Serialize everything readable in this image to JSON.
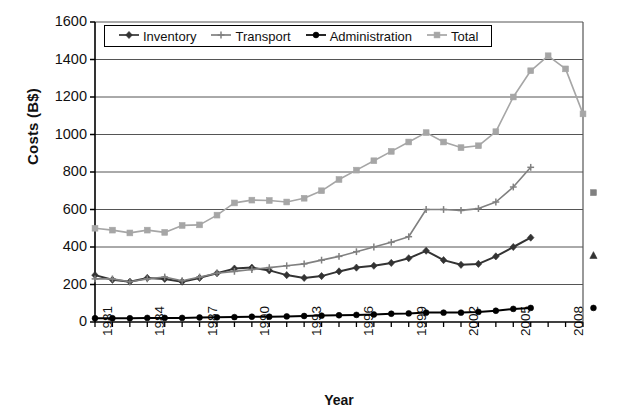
{
  "chart_data": {
    "type": "line",
    "title": "",
    "xlabel": "Year",
    "ylabel": "Costs (B$)",
    "xlim": [
      1981,
      2009
    ],
    "ylim": [
      0,
      1600
    ],
    "ytick_step": 200,
    "yticks": [
      "0",
      "200",
      "400",
      "600",
      "800",
      "1000",
      "1200",
      "1400",
      "1600"
    ],
    "xticks": [
      "1981",
      "1984",
      "1987",
      "1990",
      "1993",
      "1996",
      "1999",
      "2002",
      "2005",
      "2008"
    ],
    "xticks_all": [
      1981,
      1982,
      1983,
      1984,
      1985,
      1986,
      1987,
      1988,
      1989,
      1990,
      1991,
      1992,
      1993,
      1994,
      1995,
      1996,
      1997,
      1998,
      1999,
      2000,
      2001,
      2002,
      2003,
      2004,
      2005,
      2006,
      2007,
      2008,
      2009
    ],
    "grid": "horizontal",
    "legend_position": "top-inside",
    "x": [
      1981,
      1982,
      1983,
      1984,
      1985,
      1986,
      1987,
      1988,
      1989,
      1990,
      1991,
      1992,
      1993,
      1994,
      1995,
      1996,
      1997,
      1998,
      1999,
      2000,
      2001,
      2002,
      2003,
      2004,
      2005,
      2006
    ],
    "series": [
      {
        "name": "Inventory",
        "color": "#333333",
        "marker": "diamond",
        "values": [
          250,
          225,
          215,
          235,
          230,
          215,
          235,
          260,
          285,
          290,
          275,
          250,
          235,
          245,
          270,
          290,
          300,
          315,
          340,
          380,
          330,
          305,
          310,
          350,
          400,
          450
        ]
      },
      {
        "name": "Transport",
        "color": "#808080",
        "marker": "plus",
        "values": [
          230,
          230,
          215,
          230,
          240,
          220,
          240,
          260,
          270,
          280,
          290,
          300,
          310,
          330,
          350,
          375,
          400,
          425,
          455,
          600,
          600,
          595,
          605,
          640,
          720,
          825
        ]
      },
      {
        "name": "Administration",
        "color": "#000000",
        "marker": "circle",
        "values": [
          20,
          20,
          20,
          22,
          22,
          22,
          24,
          25,
          26,
          28,
          28,
          30,
          32,
          34,
          36,
          38,
          40,
          44,
          46,
          50,
          50,
          50,
          54,
          60,
          70,
          75
        ]
      },
      {
        "name": "Total",
        "color": "#a6a6a6",
        "marker": "square",
        "values": [
          500,
          490,
          475,
          490,
          478,
          515,
          518,
          570,
          635,
          650,
          648,
          640,
          660,
          700,
          760,
          810,
          860,
          910,
          960,
          1010,
          960,
          930,
          940,
          1015,
          1200,
          1340
        ]
      }
    ],
    "extra_points": [
      {
        "series": "Total",
        "x": 2007,
        "y": 1420
      },
      {
        "series": "Total",
        "x": 2008,
        "y": 1350
      },
      {
        "series": "Total",
        "x": 2009,
        "y": 1110
      }
    ],
    "isolated_markers": [
      {
        "series": "Total",
        "label": "Total-2009-marker",
        "x": 2009.6,
        "y": 690,
        "marker": "square",
        "color": "#808080"
      },
      {
        "series": "Inventory",
        "label": "Inventory-2009-marker",
        "x": 2009.6,
        "y": 355,
        "marker": "triangle",
        "color": "#333333"
      },
      {
        "series": "Administration",
        "label": "Administration-2009-marker",
        "x": 2009.6,
        "y": 75,
        "marker": "circle",
        "color": "#000000"
      }
    ],
    "annotations": []
  },
  "legend": {
    "items": [
      {
        "label": "Inventory",
        "color": "#333333",
        "marker": "diamond"
      },
      {
        "label": "Transport",
        "color": "#808080",
        "marker": "plus"
      },
      {
        "label": "Administration",
        "color": "#000000",
        "marker": "circle"
      },
      {
        "label": "Total",
        "color": "#a6a6a6",
        "marker": "square"
      }
    ]
  }
}
